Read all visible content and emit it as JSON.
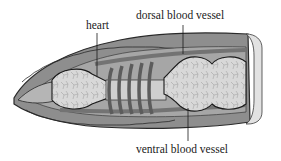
{
  "figure": {
    "labels": {
      "heart": "heart",
      "dorsal": "dorsal blood vessel",
      "ventral": "ventral blood vessel"
    },
    "heart_ring_count": 5,
    "colors": {
      "body_wall": "#8c8c8c",
      "body_outline": "#2a2a2a",
      "inner_cavity": "#a9a9a9",
      "gut": "#d6d6d6",
      "vessel": "#7a7a7a",
      "heart_ring": "#5e5e5e",
      "cap": "#e2e2e2",
      "leader": "#1a1a1a"
    }
  }
}
